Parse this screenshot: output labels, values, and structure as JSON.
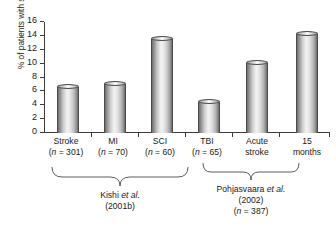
{
  "chart_data": {
    "type": "bar",
    "title": "",
    "xlabel": "",
    "ylabel": "% of patients with suicidal plan",
    "ylim": [
      0,
      16
    ],
    "yticks": [
      "0",
      "2",
      "4",
      "6",
      "8",
      "10",
      "12",
      "14",
      "16"
    ],
    "grid": false,
    "legend": "none",
    "categories": [
      "Stroke",
      "MI",
      "SCI",
      "TBI",
      "Acute stroke",
      "15 months"
    ],
    "values": [
      6.6,
      7.1,
      13.5,
      4.5,
      10.1,
      14.3
    ],
    "bars": [
      {
        "label_line1": "Stroke",
        "label_line2": "(n = 301)",
        "value": 6.6,
        "n": 301,
        "group": 0
      },
      {
        "label_line1": "MI",
        "label_line2": "(n = 70)",
        "value": 7.1,
        "n": 70,
        "group": 0
      },
      {
        "label_line1": "SCI",
        "label_line2": "(n = 60)",
        "value": 13.5,
        "n": 60,
        "group": 0
      },
      {
        "label_line1": "TBI",
        "label_line2": "(n = 65)",
        "value": 4.5,
        "n": 65,
        "group": 0
      },
      {
        "label_line1": "Acute",
        "label_line2": "stroke",
        "value": 10.1,
        "n": null,
        "group": 1
      },
      {
        "label_line1": "15",
        "label_line2": "months",
        "value": 14.3,
        "n": null,
        "group": 1
      }
    ],
    "groups": [
      {
        "caption_line1_pre": "Kishi ",
        "caption_line1_em": "et al.",
        "caption_line2": "(2001b)",
        "caption_line3": "",
        "bars": [
          0,
          1,
          2,
          3
        ]
      },
      {
        "caption_line1_pre": "Pohjasvaara ",
        "caption_line1_em": "et al.",
        "caption_line2": "(2002)",
        "caption_line3": "(n = 387)",
        "bars": [
          4,
          5
        ]
      }
    ]
  },
  "colors": {
    "axis": "#3b3b3b",
    "text": "#1a1a1a",
    "bar_light": "#f4f4f4",
    "bar_dark": "#6b6b6b",
    "background": "#ffffff"
  }
}
